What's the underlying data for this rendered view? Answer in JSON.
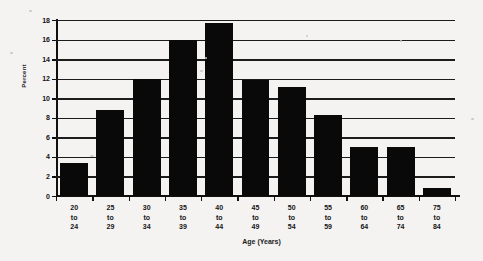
{
  "chart_data": {
    "type": "bar",
    "title": "",
    "xlabel": "Age (Years)",
    "ylabel": "Percent",
    "categories": [
      "20 to 24",
      "25 to 29",
      "30 to 34",
      "35 to 39",
      "40 to 44",
      "45 to 49",
      "50 to 54",
      "55 to 59",
      "60 to 64",
      "65 to 74",
      "75 to 84"
    ],
    "category_lines": [
      [
        "20",
        "to",
        "24"
      ],
      [
        "25",
        "to",
        "29"
      ],
      [
        "30",
        "to",
        "34"
      ],
      [
        "35",
        "to",
        "39"
      ],
      [
        "40",
        "to",
        "44"
      ],
      [
        "45",
        "to",
        "49"
      ],
      [
        "50",
        "to",
        "54"
      ],
      [
        "55",
        "to",
        "59"
      ],
      [
        "60",
        "to",
        "64"
      ],
      [
        "65",
        "to",
        "74"
      ],
      [
        "75",
        "to",
        "84"
      ]
    ],
    "values": [
      3.4,
      8.8,
      12.0,
      16.0,
      17.7,
      11.9,
      11.2,
      8.3,
      5.0,
      5.0,
      0.8
    ],
    "ylim": [
      0,
      18
    ],
    "ytick_labels": [
      "0",
      "2",
      "4",
      "6",
      "8",
      "10",
      "12",
      "14",
      "16",
      "18"
    ],
    "ytick_values": [
      0,
      2,
      4,
      6,
      8,
      10,
      12,
      14,
      16,
      18
    ],
    "grid": true,
    "legend": "none",
    "bar_color": "#090909",
    "axis_color": "#101010",
    "background_color": "#f4f3f1"
  }
}
